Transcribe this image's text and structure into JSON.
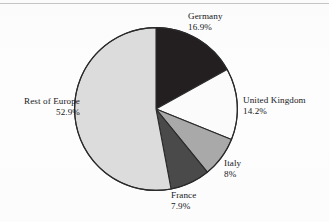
{
  "figure": {
    "title": "",
    "background_color": "#fcfcfc",
    "rule_color": "#b9babc"
  },
  "chart_data": {
    "type": "pie",
    "title": "",
    "xlabel": "",
    "ylabel": "",
    "legend_position": "none",
    "labels_position": "outside-perimeter",
    "start_angle_deg": 0,
    "direction": "clockwise",
    "categories": [
      "Germany",
      "United Kingdom",
      "Italy",
      "France",
      "Rest of Europe"
    ],
    "values": [
      16.9,
      14.2,
      8,
      7.9,
      52.9
    ],
    "value_labels": [
      "16.9%",
      "14.2%",
      "8%",
      "7.9%",
      "52.9%"
    ],
    "unit": "%",
    "colors": [
      "#231f20",
      "#fbfbfb",
      "#a9a9a9",
      "#4a4a4a",
      "#dcdcdc"
    ],
    "slice_border_color": "#2a2a2a",
    "slices": [
      {
        "name": "Germany",
        "value": 16.9,
        "label": "Germany",
        "pct_text": "16.9%",
        "color": "#231f20"
      },
      {
        "name": "United Kingdom",
        "value": 14.2,
        "label": "United Kingdom",
        "pct_text": "14.2%",
        "color": "#fbfbfb"
      },
      {
        "name": "Italy",
        "value": 8,
        "label": "Italy",
        "pct_text": "8%",
        "color": "#a9a9a9"
      },
      {
        "name": "France",
        "value": 7.9,
        "label": "France",
        "pct_text": "7.9%",
        "color": "#4a4a4a"
      },
      {
        "name": "Rest of Europe",
        "value": 52.9,
        "label": "Rest of Europe",
        "pct_text": "52.9%",
        "color": "#dcdcdc"
      }
    ]
  }
}
